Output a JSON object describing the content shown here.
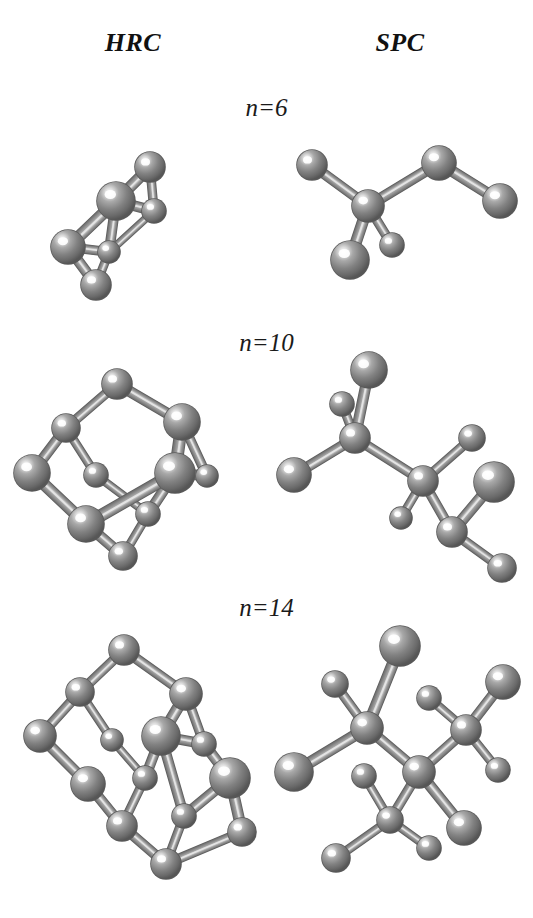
{
  "figure": {
    "background_color": "#ffffff",
    "atom_color": "#808080",
    "atom_highlight_color": "#ffffff",
    "atom_shadow_color": "#4a4a4a",
    "bond_color": "#8c8c8c",
    "bond_highlight_color": "#d8d8d8",
    "label_color": "#111111"
  },
  "columns": [
    {
      "id": "hrc",
      "label": "HRC"
    },
    {
      "id": "spc",
      "label": "SPC"
    }
  ],
  "rows": [
    {
      "id": "n6",
      "label": "n=6"
    },
    {
      "id": "n10",
      "label": "n=10"
    },
    {
      "id": "n14",
      "label": "n=14"
    }
  ],
  "structures": {
    "hrc_n6": {
      "name": "HRC n=6 cage cluster",
      "atoms": [
        {
          "x": 104,
          "y": 34,
          "r": 15
        },
        {
          "x": 70,
          "y": 68,
          "r": 19
        },
        {
          "x": 108,
          "y": 78,
          "r": 12
        },
        {
          "x": 22,
          "y": 114,
          "r": 17
        },
        {
          "x": 63,
          "y": 119,
          "r": 11
        },
        {
          "x": 50,
          "y": 152,
          "r": 15
        }
      ],
      "bonds": [
        [
          0,
          1
        ],
        [
          0,
          2
        ],
        [
          1,
          2
        ],
        [
          1,
          3
        ],
        [
          1,
          4
        ],
        [
          2,
          4
        ],
        [
          3,
          4
        ],
        [
          3,
          5
        ],
        [
          4,
          5
        ]
      ]
    },
    "spc_n6": {
      "name": "SPC n=6 branched chain",
      "atoms": [
        {
          "x": 20,
          "y": 32,
          "r": 15
        },
        {
          "x": 76,
          "y": 73,
          "r": 16
        },
        {
          "x": 147,
          "y": 30,
          "r": 17
        },
        {
          "x": 208,
          "y": 68,
          "r": 17
        },
        {
          "x": 58,
          "y": 127,
          "r": 19
        },
        {
          "x": 100,
          "y": 112,
          "r": 12
        }
      ],
      "bonds": [
        [
          0,
          1
        ],
        [
          1,
          2
        ],
        [
          2,
          3
        ],
        [
          1,
          4
        ],
        [
          1,
          5
        ]
      ]
    },
    "hrc_n10": {
      "name": "HRC n=10 diamondoid cage",
      "atoms": [
        {
          "x": 93,
          "y": 12,
          "r": 15
        },
        {
          "x": 42,
          "y": 56,
          "r": 14
        },
        {
          "x": 158,
          "y": 50,
          "r": 18
        },
        {
          "x": 8,
          "y": 101,
          "r": 18
        },
        {
          "x": 72,
          "y": 103,
          "r": 12
        },
        {
          "x": 151,
          "y": 101,
          "r": 20
        },
        {
          "x": 183,
          "y": 104,
          "r": 11
        },
        {
          "x": 62,
          "y": 152,
          "r": 18
        },
        {
          "x": 124,
          "y": 142,
          "r": 12
        },
        {
          "x": 99,
          "y": 184,
          "r": 14
        }
      ],
      "bonds": [
        [
          0,
          1
        ],
        [
          0,
          2
        ],
        [
          1,
          3
        ],
        [
          1,
          4
        ],
        [
          2,
          5
        ],
        [
          2,
          6
        ],
        [
          3,
          7
        ],
        [
          4,
          8
        ],
        [
          5,
          6
        ],
        [
          5,
          8
        ],
        [
          5,
          7
        ],
        [
          7,
          9
        ],
        [
          8,
          9
        ]
      ]
    },
    "spc_n10": {
      "name": "SPC n=10 branched chain",
      "atoms": [
        {
          "x": 81,
          "y": 18,
          "r": 18
        },
        {
          "x": 54,
          "y": 52,
          "r": 12
        },
        {
          "x": 67,
          "y": 86,
          "r": 15
        },
        {
          "x": 6,
          "y": 123,
          "r": 17
        },
        {
          "x": 135,
          "y": 129,
          "r": 15
        },
        {
          "x": 184,
          "y": 86,
          "r": 13
        },
        {
          "x": 113,
          "y": 166,
          "r": 11
        },
        {
          "x": 164,
          "y": 180,
          "r": 15
        },
        {
          "x": 206,
          "y": 130,
          "r": 20
        },
        {
          "x": 214,
          "y": 216,
          "r": 14
        }
      ],
      "bonds": [
        [
          0,
          2
        ],
        [
          1,
          2
        ],
        [
          2,
          3
        ],
        [
          2,
          4
        ],
        [
          4,
          5
        ],
        [
          4,
          6
        ],
        [
          4,
          7
        ],
        [
          7,
          8
        ],
        [
          7,
          9
        ]
      ]
    },
    "hrc_n14": {
      "name": "HRC n=14 diamondoid cage",
      "atoms": [
        {
          "x": 106,
          "y": 14,
          "r": 15
        },
        {
          "x": 62,
          "y": 56,
          "r": 14
        },
        {
          "x": 168,
          "y": 58,
          "r": 16
        },
        {
          "x": 22,
          "y": 100,
          "r": 16
        },
        {
          "x": 94,
          "y": 104,
          "r": 11
        },
        {
          "x": 143,
          "y": 100,
          "r": 19
        },
        {
          "x": 186,
          "y": 108,
          "r": 12
        },
        {
          "x": 70,
          "y": 148,
          "r": 17
        },
        {
          "x": 127,
          "y": 142,
          "r": 12
        },
        {
          "x": 212,
          "y": 142,
          "r": 20
        },
        {
          "x": 104,
          "y": 190,
          "r": 15
        },
        {
          "x": 166,
          "y": 180,
          "r": 12
        },
        {
          "x": 224,
          "y": 196,
          "r": 14
        },
        {
          "x": 148,
          "y": 228,
          "r": 15
        }
      ],
      "bonds": [
        [
          0,
          1
        ],
        [
          0,
          2
        ],
        [
          1,
          3
        ],
        [
          1,
          4
        ],
        [
          2,
          5
        ],
        [
          2,
          6
        ],
        [
          3,
          7
        ],
        [
          4,
          8
        ],
        [
          5,
          6
        ],
        [
          5,
          8
        ],
        [
          5,
          11
        ],
        [
          6,
          9
        ],
        [
          7,
          10
        ],
        [
          8,
          10
        ],
        [
          9,
          11
        ],
        [
          9,
          12
        ],
        [
          10,
          13
        ],
        [
          11,
          13
        ],
        [
          12,
          13
        ]
      ]
    },
    "spc_n14": {
      "name": "SPC n=14 branched chain",
      "atoms": [
        {
          "x": 112,
          "y": 10,
          "r": 20
        },
        {
          "x": 47,
          "y": 48,
          "r": 13
        },
        {
          "x": 79,
          "y": 92,
          "r": 16
        },
        {
          "x": 6,
          "y": 136,
          "r": 19
        },
        {
          "x": 131,
          "y": 136,
          "r": 16
        },
        {
          "x": 178,
          "y": 94,
          "r": 15
        },
        {
          "x": 141,
          "y": 62,
          "r": 12
        },
        {
          "x": 215,
          "y": 46,
          "r": 17
        },
        {
          "x": 210,
          "y": 134,
          "r": 12
        },
        {
          "x": 102,
          "y": 184,
          "r": 13
        },
        {
          "x": 76,
          "y": 140,
          "r": 12
        },
        {
          "x": 176,
          "y": 192,
          "r": 17
        },
        {
          "x": 48,
          "y": 222,
          "r": 14
        },
        {
          "x": 141,
          "y": 212,
          "r": 12
        }
      ],
      "bonds": [
        [
          0,
          2
        ],
        [
          1,
          2
        ],
        [
          2,
          3
        ],
        [
          2,
          4
        ],
        [
          4,
          5
        ],
        [
          5,
          6
        ],
        [
          5,
          7
        ],
        [
          5,
          8
        ],
        [
          4,
          9
        ],
        [
          9,
          10
        ],
        [
          4,
          11
        ],
        [
          9,
          12
        ],
        [
          9,
          13
        ]
      ]
    }
  }
}
